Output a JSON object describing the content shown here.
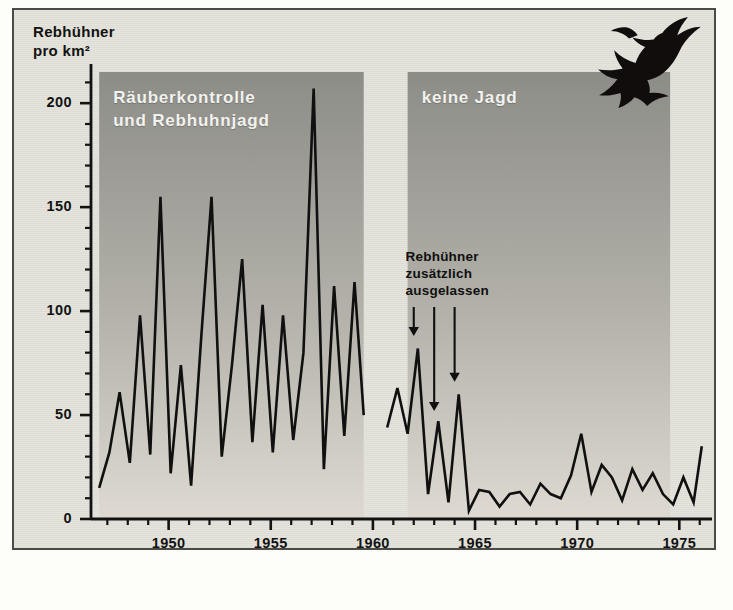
{
  "figure": {
    "y_axis_title": "Rebhühner\npro km²",
    "bands": [
      {
        "label": "Räuberkontrolle\nund Rebhuhnjagd",
        "x_start": 1946.6,
        "x_end": 1959.55
      },
      {
        "label": "keine Jagd",
        "x_start": 1961.7,
        "x_end": 1974.55
      }
    ],
    "annotation": {
      "text": "Rebhühner\nzusätzlich\nausgelassen",
      "arrows": [
        {
          "year": 1962.0,
          "tip_value": 88
        },
        {
          "year": 1963.0,
          "tip_value": 52
        },
        {
          "year": 1964.0,
          "tip_value": 66
        }
      ]
    },
    "bird_icon": "flying-partridge-icon",
    "colors": {
      "panel_background": "#e4e4dc",
      "frame": "#4a4a46",
      "band_top": "#8d8d88",
      "band_bottom": "#dedad2",
      "line": "#101010",
      "text": "#121212",
      "band_label_text": "#f2f2ee"
    }
  },
  "chart_data": {
    "type": "line",
    "title": "",
    "xlabel": "",
    "ylabel": "Rebhühner pro km²",
    "xlim": [
      1946.2,
      1976.6
    ],
    "ylim": [
      0,
      215
    ],
    "xticks": [
      1950,
      1955,
      1960,
      1965,
      1970,
      1975
    ],
    "xtick_labels": [
      "1950",
      "1955",
      "1960",
      "1965",
      "1970",
      "1975"
    ],
    "x_minor_tick_step": 1,
    "yticks": [
      0,
      50,
      100,
      150,
      200
    ],
    "ytick_labels": [
      "0",
      "50",
      "100",
      "150",
      "200"
    ],
    "y_minor_tick_step": 10,
    "grid": false,
    "legend": null,
    "series": [
      {
        "name": "Rebhühner pro km² (Räuberkontrolle und Rebhuhnjagd)",
        "x": [
          1946.6,
          1947.1,
          1947.6,
          1948.1,
          1948.6,
          1949.1,
          1949.6,
          1950.1,
          1950.6,
          1951.1,
          1951.6,
          1952.1,
          1952.6,
          1953.1,
          1953.6,
          1954.1,
          1954.6,
          1955.1,
          1955.6,
          1956.1,
          1956.6,
          1957.1,
          1957.6,
          1958.1,
          1958.6,
          1959.1,
          1959.55
        ],
        "values": [
          15,
          32,
          61,
          27,
          98,
          31,
          155,
          22,
          74,
          16,
          88,
          155,
          30,
          74,
          125,
          37,
          103,
          32,
          98,
          38,
          80,
          207,
          24,
          112,
          40,
          114,
          50
        ]
      },
      {
        "name": "Rebhühner pro km² (keine Jagd)",
        "x": [
          1960.7,
          1961.2,
          1961.7,
          1962.2,
          1962.7,
          1963.2,
          1963.7,
          1964.2,
          1964.7,
          1965.2,
          1965.7,
          1966.2,
          1966.7,
          1967.2,
          1967.7,
          1968.2,
          1968.7,
          1969.2,
          1969.7,
          1970.2,
          1970.7,
          1971.2,
          1971.7,
          1972.2,
          1972.7,
          1973.2,
          1973.7,
          1974.2,
          1974.7,
          1975.2,
          1975.7,
          1976.1
        ],
        "values": [
          44,
          63,
          41,
          82,
          12,
          47,
          8,
          60,
          4,
          14,
          13,
          6,
          12,
          13,
          7,
          17,
          12,
          10,
          21,
          41,
          13,
          26,
          20,
          9,
          24,
          14,
          22,
          12,
          7,
          20,
          8,
          35
        ]
      }
    ]
  }
}
